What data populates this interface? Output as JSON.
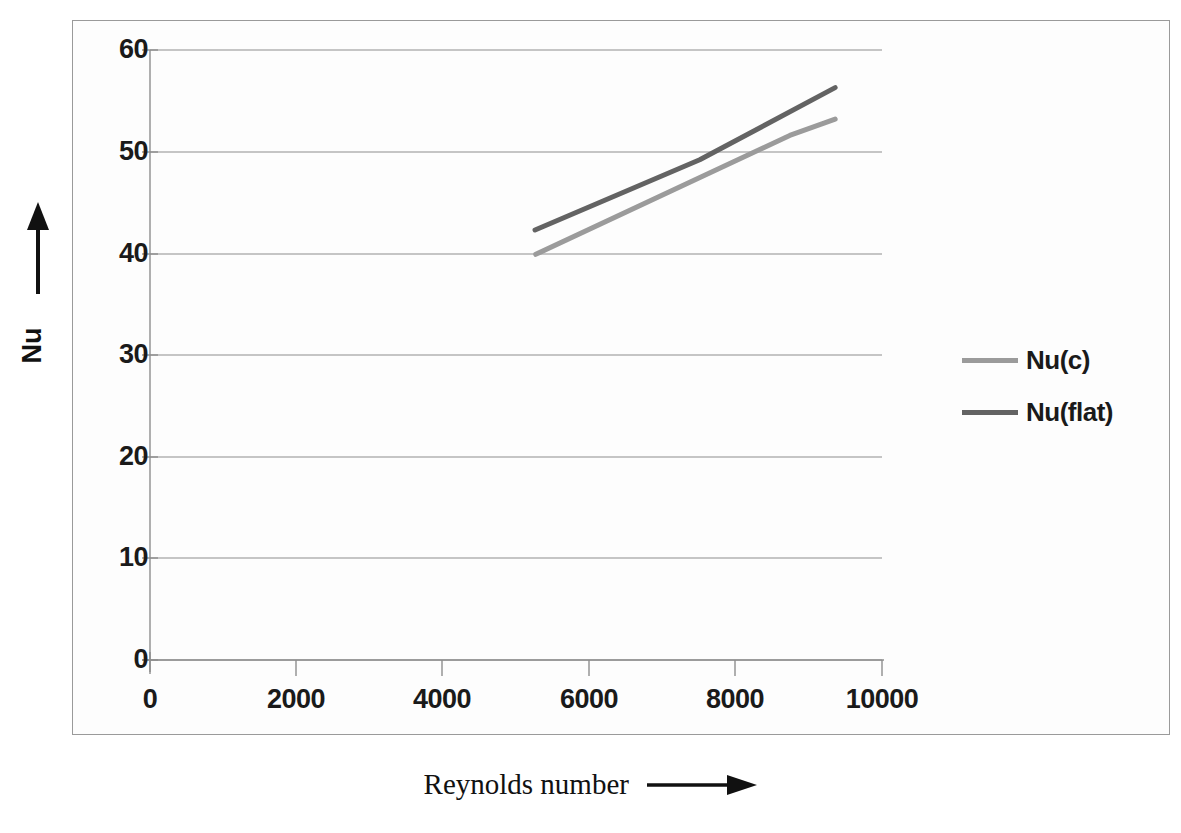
{
  "chart_data": {
    "type": "line",
    "title": "",
    "xlabel": "Reynolds number",
    "ylabel": "Nu",
    "xlim": [
      0,
      10000
    ],
    "ylim": [
      0,
      60
    ],
    "xticks": [
      "0",
      "2000",
      "4000",
      "6000",
      "8000",
      "10000"
    ],
    "xtick_values": [
      0,
      2000,
      4000,
      6000,
      8000,
      10000
    ],
    "yticks": [
      "0",
      "10",
      "20",
      "30",
      "40",
      "50",
      "60"
    ],
    "ytick_values": [
      0,
      10,
      20,
      30,
      40,
      50,
      60
    ],
    "grid": "horizontal",
    "legend_position": "right-middle",
    "series": [
      {
        "name": "Nu(c)",
        "color": "#9b9b9b",
        "x": [
          5270,
          8740,
          9360
        ],
        "values": [
          39.9,
          51.6,
          53.2
        ]
      },
      {
        "name": "Nu(flat)",
        "color": "#636363",
        "x": [
          5260,
          7510,
          9360
        ],
        "values": [
          42.3,
          49.2,
          56.3
        ]
      }
    ]
  },
  "axes": {
    "y_title": "Nu",
    "x_title": "Reynolds number",
    "y_arrow_icon": "arrow-up-icon",
    "x_arrow_icon": "arrow-right-icon"
  },
  "legend": {
    "items": [
      {
        "label": "Nu(c)",
        "color": "#9b9b9b"
      },
      {
        "label": "Nu(flat)",
        "color": "#636363"
      }
    ]
  },
  "style": {
    "grid_color": "#8d8d8d",
    "axis_color": "#8d8d8d",
    "frame_color": "#9a9a9a",
    "text_color": "#1a1a1a",
    "background": "#ffffff"
  }
}
